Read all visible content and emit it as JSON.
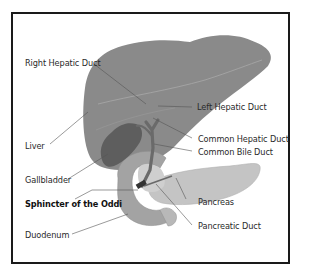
{
  "diagram": {
    "labels": {
      "right_hepatic_duct": "Right Hepatic Duct",
      "left_hepatic_duct": "Left Hepatic Duct",
      "liver": "Liver",
      "common_hepatic_duct": "Common Hepatic Duct",
      "common_bile_duct": "Common Bile Duct",
      "gallbladder": "Gallbladder",
      "sphincter_of_oddi": "Sphincter of the Oddi",
      "pancreas": "Pancreas",
      "duodenum": "Duodenum",
      "pancreatic_duct": "Pancreatic Duct"
    },
    "colors": {
      "liver": "#8a8a8a",
      "liver_edge": "#a8a8a8",
      "gallbladder": "#5e5e5e",
      "duct": "#6a6a6a",
      "duodenum": "#a3a3a3",
      "duodenum_inner": "#cfcfcf",
      "pancreas": "#c4c4c4",
      "frame": "#1a1a1a",
      "leader": "#555555"
    }
  }
}
